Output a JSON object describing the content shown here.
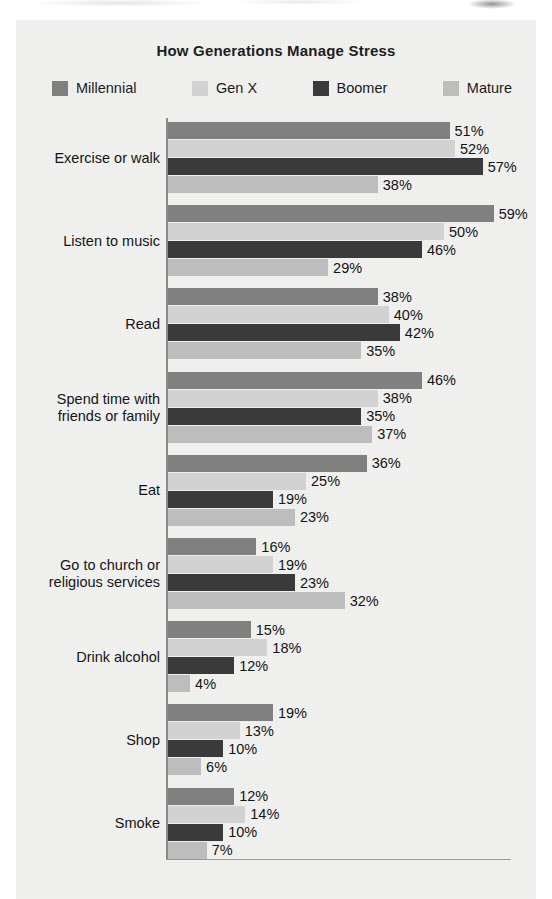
{
  "chart_data": {
    "type": "bar",
    "orientation": "horizontal",
    "title": "How Generations Manage Stress",
    "xlabel": "",
    "ylabel": "",
    "xlim": [
      0,
      60
    ],
    "grid": false,
    "legend_position": "top",
    "value_suffix": "%",
    "categories": [
      "Exercise or walk",
      "Listen to music",
      "Read",
      "Spend time with friends or family",
      "Eat",
      "Go to church or religious services",
      "Drink alcohol",
      "Shop",
      "Smoke"
    ],
    "series": [
      {
        "name": "Millennial",
        "color": "#808080",
        "values": [
          51,
          59,
          38,
          46,
          36,
          16,
          15,
          19,
          12
        ]
      },
      {
        "name": "Gen X",
        "color": "#d2d2d2",
        "values": [
          52,
          50,
          40,
          38,
          25,
          19,
          18,
          13,
          14
        ]
      },
      {
        "name": "Boomer",
        "color": "#3a3a3a",
        "values": [
          57,
          46,
          42,
          35,
          19,
          23,
          12,
          10,
          10
        ]
      },
      {
        "name": "Mature",
        "color": "#bdbdbd",
        "values": [
          38,
          29,
          35,
          37,
          23,
          32,
          4,
          6,
          7
        ]
      }
    ]
  },
  "legend": [
    {
      "label": "Millennial",
      "color": "#808080"
    },
    {
      "label": "Gen X",
      "color": "#d2d2d2"
    },
    {
      "label": "Boomer",
      "color": "#3a3a3a"
    },
    {
      "label": "Mature",
      "color": "#bdbdbd"
    }
  ],
  "category_lines": [
    [
      "Exercise or walk"
    ],
    [
      "Listen to music"
    ],
    [
      "Read"
    ],
    [
      "Spend time with",
      "friends or family"
    ],
    [
      "Eat"
    ],
    [
      "Go to church or",
      "religious services"
    ],
    [
      "Drink alcohol"
    ],
    [
      "Shop"
    ],
    [
      "Smoke"
    ]
  ],
  "labels": {
    "values": [
      [
        "51%",
        "52%",
        "57%",
        "38%"
      ],
      [
        "59%",
        "50%",
        "46%",
        "29%"
      ],
      [
        "38%",
        "40%",
        "42%",
        "35%"
      ],
      [
        "46%",
        "38%",
        "35%",
        "37%"
      ],
      [
        "36%",
        "25%",
        "19%",
        "23%"
      ],
      [
        "16%",
        "19%",
        "23%",
        "32%"
      ],
      [
        "15%",
        "18%",
        "12%",
        "4%"
      ],
      [
        "19%",
        "13%",
        "10%",
        "6%"
      ],
      [
        "12%",
        "14%",
        "10%",
        "7%"
      ]
    ]
  }
}
